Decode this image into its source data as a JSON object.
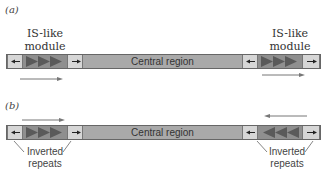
{
  "panels": [
    {
      "id": "a",
      "label": "(a)",
      "left_module_label": "IS-like\nmodule",
      "left_module_line1": "IS-like",
      "left_module_line2": "module",
      "right_module_line1": "IS-like",
      "right_module_line2": "module",
      "central_label": "Central region",
      "left_triangles_direction": "right",
      "right_triangles_direction": "right",
      "left_arrow_direction": "right",
      "right_arrow_direction": "right"
    },
    {
      "id": "b",
      "label": "(b)",
      "central_label": "Central region",
      "left_repeats_line1": "Inverted",
      "left_repeats_line2": "repeats",
      "right_repeats_line1": "Inverted",
      "right_repeats_line2": "repeats",
      "left_triangles_direction": "right",
      "right_triangles_direction": "left",
      "left_arrow_direction": "right",
      "right_arrow_direction": "left"
    }
  ],
  "colors": {
    "central": "#a9a9a9",
    "inverted_repeat_box": "#d6d6d6",
    "triangle_box": "#8f8f8f",
    "triangle": "#5a5a5a",
    "arrow": "#777777"
  }
}
